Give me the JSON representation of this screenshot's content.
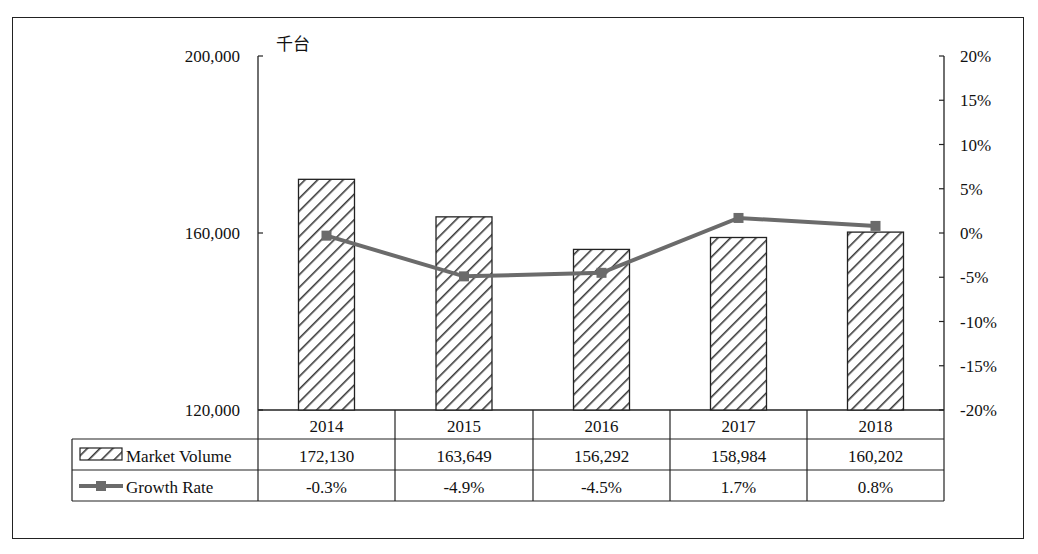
{
  "chart_data": {
    "type": "bar+line",
    "title": "",
    "unit_label": "千台",
    "categories": [
      "2014",
      "2015",
      "2016",
      "2017",
      "2018"
    ],
    "series": [
      {
        "name": "Market Volume",
        "type": "bar",
        "axis": "left",
        "values": [
          172130,
          163649,
          156292,
          158984,
          160202
        ],
        "labels": [
          "172,130",
          "163,649",
          "156,292",
          "158,984",
          "160,202"
        ]
      },
      {
        "name": "Growth Rate",
        "type": "line",
        "axis": "right",
        "values": [
          -0.3,
          -4.9,
          -4.5,
          1.7,
          0.8
        ],
        "labels": [
          "-0.3%",
          "-4.9%",
          "-4.5%",
          "1.7%",
          "0.8%"
        ]
      }
    ],
    "left_axis": {
      "ylim": [
        120000,
        200000
      ],
      "ticks": [
        "120,000",
        "160,000",
        "200,000"
      ]
    },
    "right_axis": {
      "ylim": [
        -20,
        20
      ],
      "ticks": [
        "20%",
        "15%",
        "10%",
        "5%",
        "0%",
        "-5%",
        "-10%",
        "-15%",
        "-20%"
      ]
    },
    "grid": false,
    "legend": "data table below chart"
  },
  "colors": {
    "line": "#6b6b6b",
    "bar_hatch": "#333333",
    "border": "#222222"
  }
}
